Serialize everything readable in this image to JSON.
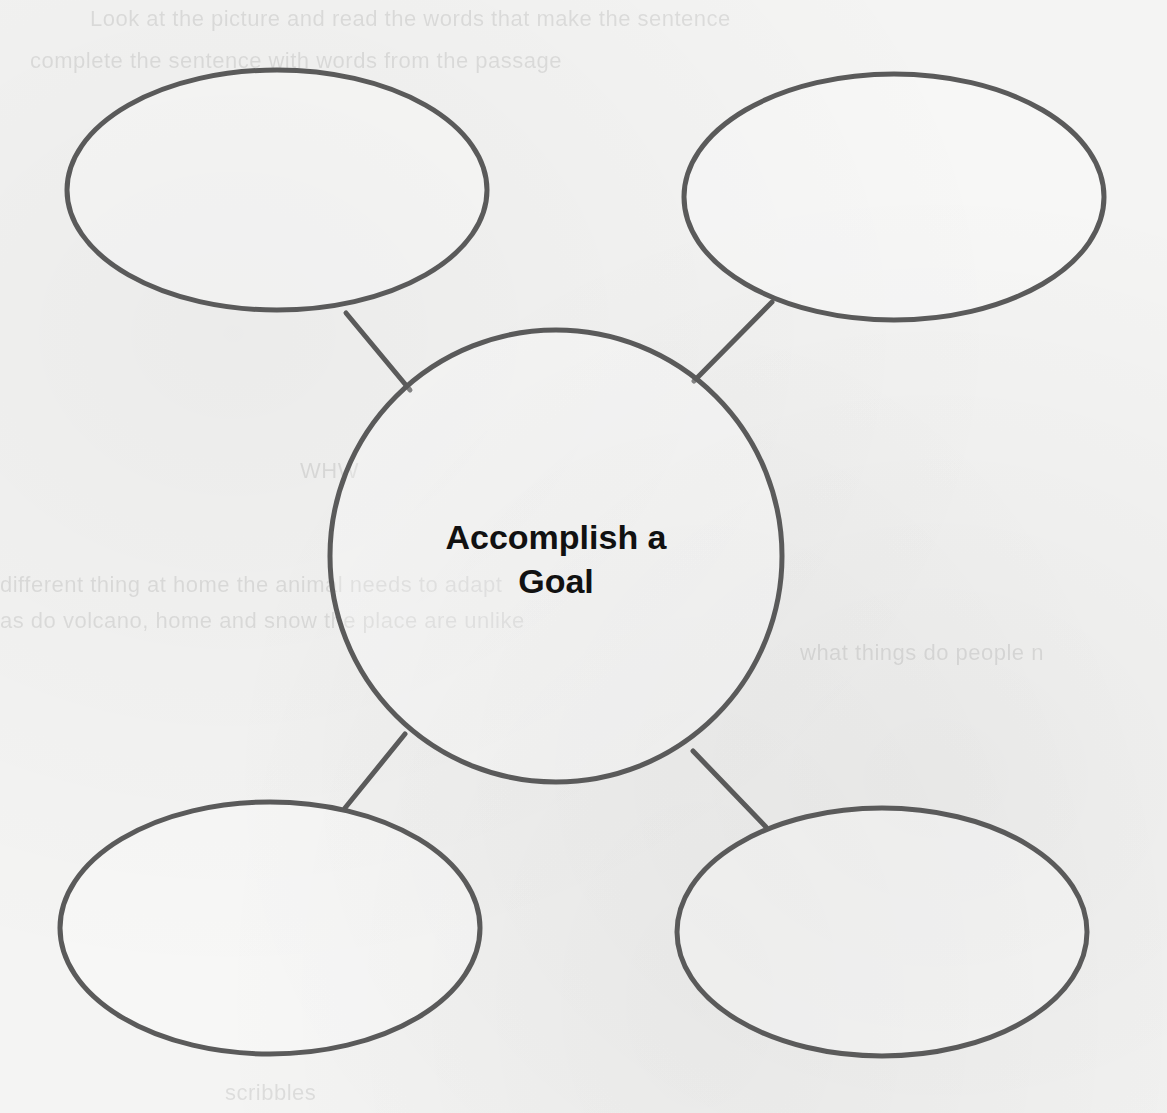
{
  "diagram": {
    "type": "concept-web",
    "center_label_line1": "Accomplish a",
    "center_label_line2": "Goal",
    "outer_nodes": [
      {
        "position": "top-left",
        "label": ""
      },
      {
        "position": "top-right",
        "label": ""
      },
      {
        "position": "bottom-left",
        "label": ""
      },
      {
        "position": "bottom-right",
        "label": ""
      }
    ],
    "stroke_color": "#5a5a5a",
    "text_color": "#111111"
  }
}
